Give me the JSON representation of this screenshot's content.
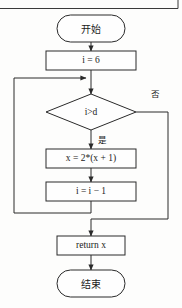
{
  "diagram": {
    "language": "zh-CN",
    "colors": {
      "background": "#fdfdfc",
      "stroke": "#2a2a2a",
      "shape_fill": "#fefefe",
      "text": "#1b1b1b"
    },
    "nodes": {
      "start": {
        "label": "开始",
        "shape": "terminator"
      },
      "init": {
        "label": "i = 6",
        "shape": "process"
      },
      "decision": {
        "label": "i>d",
        "shape": "decision"
      },
      "body1": {
        "label": "x = 2*(x + 1)",
        "shape": "process"
      },
      "body2": {
        "label": "i = i − 1",
        "shape": "process"
      },
      "ret": {
        "label": "return x",
        "shape": "process"
      },
      "end": {
        "label": "结束",
        "shape": "terminator"
      }
    },
    "edge_labels": {
      "yes": "是",
      "no": "否"
    }
  }
}
